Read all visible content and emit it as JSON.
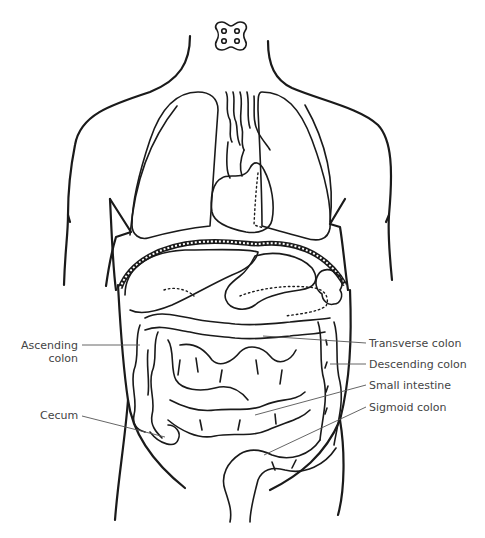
{
  "diagram": {
    "line_color": "#1a1a1a",
    "label_color": "#444444",
    "labels": {
      "ascending_colon_line1": "Ascending",
      "ascending_colon_line2": "colon",
      "cecum": "Cecum",
      "transverse_colon": "Transverse colon",
      "descending_colon": "Descending colon",
      "small_intestine": "Small intestine",
      "sigmoid_colon": "Sigmoid colon"
    }
  }
}
